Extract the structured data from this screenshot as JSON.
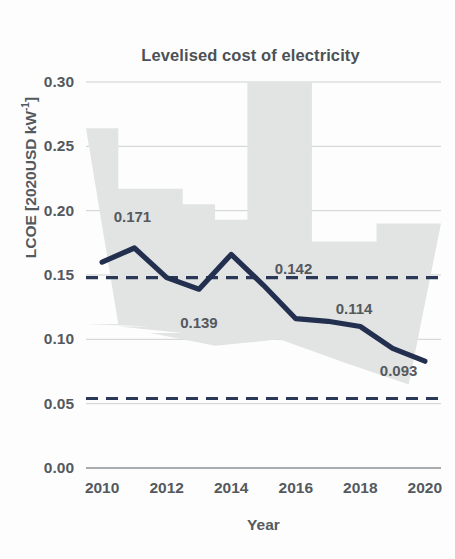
{
  "chart_data": {
    "type": "line",
    "title": "Levelised cost of electricity",
    "xlabel": "Year",
    "ylabel": "LCOE [2020USD kW",
    "ylabel_sup": "-1",
    "ylabel_suffix": "]",
    "ylabel_full": "LCOE [2020USD kW-1]",
    "x": [
      2010,
      2011,
      2012,
      2013,
      2014,
      2015,
      2016,
      2017,
      2018,
      2019,
      2020
    ],
    "values": [
      0.16,
      0.171,
      0.148,
      0.139,
      0.166,
      0.142,
      0.116,
      0.114,
      0.11,
      0.093,
      0.083
    ],
    "series": [
      {
        "name": "Global weighted average LCOE",
        "values": [
          0.16,
          0.171,
          0.148,
          0.139,
          0.166,
          0.142,
          0.116,
          0.114,
          0.11,
          0.093,
          0.083
        ]
      }
    ],
    "band": {
      "name": "Cost range (5th to 95th percentile)",
      "lower": [
        0.112,
        0.11,
        0.105,
        0.095,
        0.095,
        0.1,
        0.1,
        0.082,
        0.082,
        0.065,
        0.065
      ],
      "upper": [
        0.264,
        0.217,
        0.217,
        0.205,
        0.193,
        0.31,
        0.31,
        0.176,
        0.176,
        0.19,
        0.19
      ],
      "color": "#e2e3e3"
    },
    "reference_lines": [
      {
        "name": "upper-fossil-fuel-cost-line",
        "value": 0.148,
        "style": "dashed",
        "color": "#2b3858"
      },
      {
        "name": "lower-fossil-fuel-cost-line",
        "value": 0.054,
        "style": "dashed",
        "color": "#2b3858"
      }
    ],
    "point_labels": [
      {
        "year": 2011,
        "text": "0.171",
        "x": 2011,
        "y": 0.171,
        "dx": -2,
        "dy": 0.0245
      },
      {
        "year": 2013,
        "text": "0.139",
        "x": 2013,
        "y": 0.139,
        "dx": 0,
        "dy": -0.0255
      },
      {
        "year": 2015,
        "text": "0.142",
        "x": 2015,
        "y": 0.142,
        "dx": 30,
        "dy": 0.0135
      },
      {
        "year": 2017,
        "text": "0.114",
        "x": 2017,
        "y": 0.114,
        "dx": 26,
        "dy": 0.0105
      },
      {
        "year": 2019,
        "text": "0.093",
        "x": 2019,
        "y": 0.093,
        "dx": 6,
        "dy": -0.0165
      }
    ],
    "yticks": [
      0.3,
      0.25,
      0.2,
      0.15,
      0.1,
      0.05,
      0.0
    ],
    "ytick_labels": [
      "0.30",
      "0.25",
      "0.20",
      "0.15",
      "0.10",
      "0.05",
      "0.00"
    ],
    "xticks": [
      2010,
      2012,
      2014,
      2016,
      2018,
      2020
    ],
    "xtick_labels": [
      "2010",
      "2012",
      "2014",
      "2016",
      "2018",
      "2020"
    ],
    "ylim": [
      0.0,
      0.3
    ],
    "xlim": [
      2009.5,
      2020.5
    ],
    "grid": true,
    "grid_axis": "y",
    "legend": "none",
    "line_color": "#232f4f",
    "grid_color": "#c9cbcc",
    "axis_color": "#8b9093",
    "text_color": "#54595e"
  }
}
